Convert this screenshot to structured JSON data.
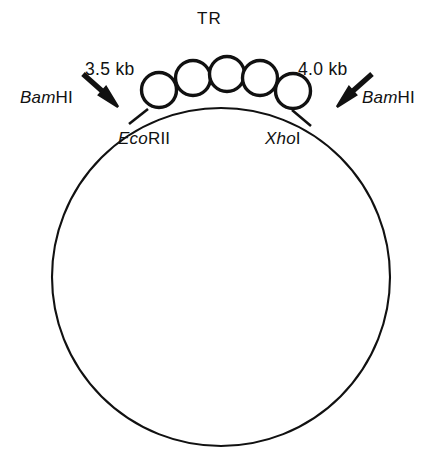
{
  "figure": {
    "type": "plasmid-restriction-map",
    "background_color": "#ffffff",
    "line_color": "#111111"
  },
  "labels": {
    "tandem_repeat": "TR",
    "fragment_left": "3.5 kb",
    "fragment_right": "4.0 kb",
    "site_bamhi_left_genus": "Bam",
    "site_bamhi_left_numeral": "HI",
    "site_bamhi_right_genus": "Bam",
    "site_bamhi_right_numeral": "HI",
    "site_ecorii_genus": "Eco",
    "site_ecorii_numeral": "RII",
    "site_xhoi_genus": "Xho",
    "site_xhoi_numeral": "I"
  },
  "geometry": {
    "plasmid_circle": {
      "cx": 221,
      "cy": 277,
      "r": 169,
      "stroke_width": 2.1
    },
    "repeat_radius": 17.5,
    "repeat_stroke_width": 3.4,
    "repeat_count": 5,
    "repeat_centers": [
      {
        "cx": 159,
        "cy": 90
      },
      {
        "cx": 193,
        "cy": 78
      },
      {
        "cx": 227,
        "cy": 74
      },
      {
        "cx": 260,
        "cy": 78
      },
      {
        "cx": 293,
        "cy": 91
      }
    ],
    "ticks": [
      {
        "name": "ecorii-tick",
        "x1": 129,
        "y1": 124,
        "x2": 148,
        "y2": 109
      },
      {
        "name": "xhoi-tick",
        "x1": 292,
        "y1": 110,
        "x2": 311,
        "y2": 126
      }
    ],
    "arrows": [
      {
        "name": "bamhi-left-arrow",
        "x1": 83,
        "y1": 75,
        "x2": 117,
        "y2": 105
      },
      {
        "name": "bamhi-right-arrow",
        "x1": 372,
        "y1": 75,
        "x2": 338,
        "y2": 105
      }
    ]
  }
}
